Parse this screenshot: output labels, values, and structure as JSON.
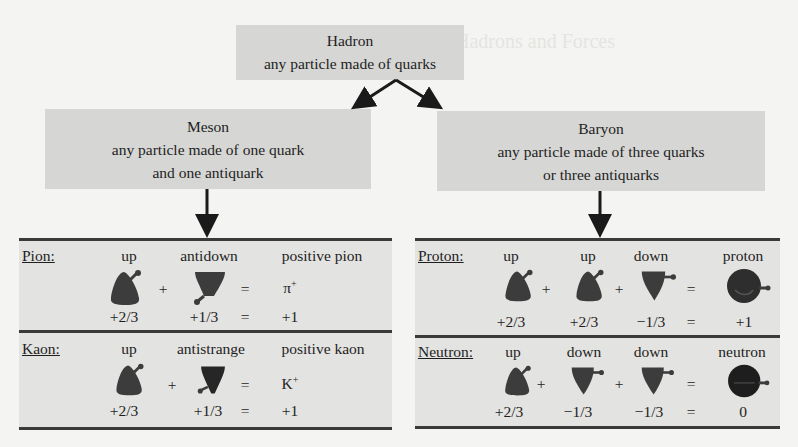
{
  "background_ghost": {
    "heading": "Hadrons and Forces",
    "lines": [
      "The particles that are made of quarks...",
      "...",
      "..."
    ]
  },
  "hadron": {
    "title": "Hadron",
    "desc": "any particle made of quarks"
  },
  "meson": {
    "title": "Meson",
    "desc1": "any particle made of one quark",
    "desc2": "and one antiquark"
  },
  "baryon": {
    "title": "Baryon",
    "desc1": "any particle made of three quarks",
    "desc2": "or three antiquarks"
  },
  "colors": {
    "box": "#d6d6d4",
    "panel": "#e3e3e1",
    "rule": "#3a3a3a",
    "quark": "#3c3c3c"
  },
  "pion": {
    "label": "Pion:",
    "names": [
      "up",
      "antidown",
      "positive pion"
    ],
    "ops": [
      "+",
      "="
    ],
    "symbol": "π",
    "symbol_sup": "+",
    "charges": [
      "+2/3",
      "+1/3",
      "=",
      "+1"
    ],
    "icons": [
      "up-quark-icon",
      "antidown-quark-icon"
    ]
  },
  "kaon": {
    "label": "Kaon:",
    "names": [
      "up",
      "antistrange",
      "positive kaon"
    ],
    "ops": [
      "+",
      "="
    ],
    "symbol": "K",
    "symbol_sup": "+",
    "charges": [
      "+2/3",
      "+1/3",
      "=",
      "+1"
    ],
    "icons": [
      "up-quark-icon",
      "antistrange-quark-icon"
    ]
  },
  "proton": {
    "label": "Proton:",
    "names": [
      "up",
      "up",
      "down",
      "proton"
    ],
    "ops": [
      "+",
      "+",
      "="
    ],
    "charges": [
      "+2/3",
      "+2/3",
      "−1/3",
      "=",
      "+1"
    ],
    "icons": [
      "up-quark-icon",
      "up-quark-icon",
      "down-quark-icon",
      "proton-icon"
    ]
  },
  "neutron": {
    "label": "Neutron:",
    "names": [
      "up",
      "down",
      "down",
      "neutron"
    ],
    "ops": [
      "+",
      "+",
      "="
    ],
    "charges": [
      "+2/3",
      "−1/3",
      "−1/3",
      "=",
      "0"
    ],
    "icons": [
      "up-quark-icon",
      "down-quark-icon",
      "down-quark-icon",
      "neutron-icon"
    ]
  }
}
